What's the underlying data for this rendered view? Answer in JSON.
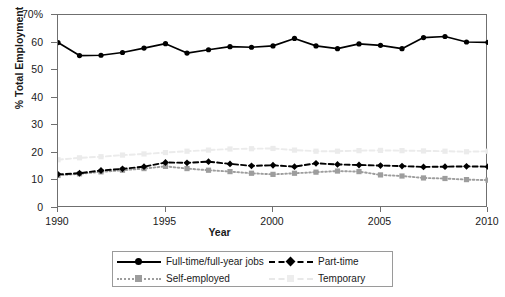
{
  "chart_data": {
    "type": "line",
    "title": "",
    "xlabel": "Year",
    "ylabel": "% Total Employment",
    "xlim": [
      1990,
      2010
    ],
    "ylim": [
      0,
      70
    ],
    "xticks": [
      "1990",
      "1995",
      "2000",
      "2005",
      "2010"
    ],
    "xtick_values": [
      1990,
      1995,
      2000,
      2005,
      2010
    ],
    "yticks": [
      "0",
      "10",
      "20",
      "30",
      "40",
      "50",
      "60",
      "70%"
    ],
    "ytick_values": [
      0,
      10,
      20,
      30,
      40,
      50,
      60,
      70
    ],
    "grid": false,
    "legend_position": "below",
    "x": [
      1990,
      1991,
      1992,
      1993,
      1994,
      1995,
      1996,
      1997,
      1998,
      1999,
      2000,
      2001,
      2002,
      2003,
      2004,
      2005,
      2006,
      2007,
      2008,
      2009,
      2010
    ],
    "series": [
      {
        "name": "Full-time/full-year jobs",
        "color": "#000000",
        "line_style": "solid",
        "marker": "circle",
        "values": [
          60.0,
          55.3,
          55.4,
          56.4,
          58.0,
          59.6,
          56.2,
          57.4,
          58.5,
          58.3,
          58.8,
          61.5,
          58.8,
          57.8,
          59.5,
          59.0,
          57.8,
          61.8,
          62.2,
          60.2,
          60.1
        ]
      },
      {
        "name": "Part-time",
        "color": "#000000",
        "line_style": "dashed",
        "marker": "diamond",
        "values": [
          12.2,
          12.6,
          13.6,
          14.2,
          15.0,
          16.5,
          16.4,
          16.8,
          16.0,
          15.3,
          15.5,
          15.0,
          16.2,
          15.8,
          15.6,
          15.4,
          15.2,
          14.9,
          15.0,
          15.1,
          15.0
        ]
      },
      {
        "name": "Self-employed",
        "color": "#9d9d9d",
        "line_style": "dotted",
        "marker": "square",
        "values": [
          11.8,
          12.4,
          13.1,
          13.7,
          14.3,
          15.1,
          14.3,
          13.7,
          13.2,
          12.6,
          12.2,
          12.6,
          13.0,
          13.4,
          13.2,
          12.0,
          11.6,
          10.9,
          10.7,
          10.3,
          10.1
        ]
      },
      {
        "name": "Temporary",
        "color": "#ebebeb",
        "line_style": "dashed",
        "marker": "square",
        "values": [
          17.5,
          18.2,
          18.6,
          19.2,
          19.6,
          20.1,
          20.6,
          21.0,
          21.4,
          21.5,
          21.6,
          21.0,
          20.6,
          20.6,
          20.8,
          20.9,
          20.8,
          20.7,
          20.6,
          20.4,
          20.6
        ]
      }
    ]
  },
  "legend": {
    "entries": [
      {
        "label": "Full-time/full-year jobs"
      },
      {
        "label": "Part-time"
      },
      {
        "label": "Self-employed"
      },
      {
        "label": "Temporary"
      }
    ]
  }
}
